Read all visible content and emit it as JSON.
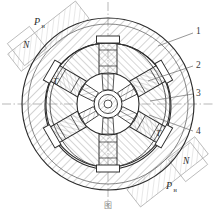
{
  "figure": {
    "type": "engineering-cross-section",
    "background": "#ffffff",
    "line_color": "#2b2b2b",
    "hatch_color": "#7a7a7a",
    "centerline_color": "#9a9a9a",
    "annotation_color": "#8c8c8c",
    "geometry": {
      "center_x": 108,
      "center_y": 104,
      "outer_circle_r": 88,
      "housing_inner_r": 68,
      "cam_ring_r": 60,
      "rotor_outer_r": 30,
      "hub_core_r": 13,
      "piston_count": 6,
      "piston_angles_deg": [
        90,
        30,
        330,
        270,
        210,
        150
      ],
      "hatch_angle_deg": 45
    },
    "callouts": [
      {
        "id": "1",
        "label": "1",
        "x": 198,
        "y": 31,
        "leader_to_x": 160,
        "leader_to_y": 44
      },
      {
        "id": "2",
        "label": "2",
        "x": 198,
        "y": 65,
        "leader_to_x": 150,
        "leader_to_y": 80
      },
      {
        "id": "3",
        "label": "3",
        "x": 198,
        "y": 93,
        "leader_to_x": 152,
        "leader_to_y": 100
      },
      {
        "id": "4",
        "label": "4",
        "x": 198,
        "y": 131,
        "leader_to_x": 150,
        "leader_to_y": 116
      }
    ],
    "force_annotations": [
      {
        "id": "ph-top-left",
        "symbol": "P",
        "subscript": "н",
        "x": 38,
        "y": 22
      },
      {
        "id": "n-top-left",
        "symbol": "N",
        "subscript": "",
        "x": 26,
        "y": 44
      },
      {
        "id": "n-bottom-right",
        "symbol": "N",
        "subscript": "",
        "x": 186,
        "y": 166
      },
      {
        "id": "ph-bottom-right",
        "symbol": "P",
        "subscript": "н",
        "x": 170,
        "y": 186
      }
    ],
    "torque_labels": [
      {
        "id": "t-upper-left",
        "label": "T",
        "x": 55,
        "y": 81
      },
      {
        "id": "t-lower-right",
        "label": "T",
        "x": 158,
        "y": 133
      }
    ]
  },
  "caption": {
    "text": "图",
    "visible": "clipped"
  }
}
